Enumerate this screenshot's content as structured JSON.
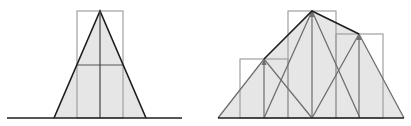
{
  "colors": {
    "fill": "#e6e6e6",
    "rect_stroke": "#a0a0a0",
    "triangle_stroke": "#6e6e6e",
    "hull_stroke": "#1e1e1e",
    "baseline": "#1e1e1e",
    "background": "#ffffff"
  },
  "panels": [
    {
      "name": "single-kernel",
      "baseline": {
        "x1": 7,
        "x2": 182,
        "y": 118
      },
      "rects": [
        {
          "x": 77,
          "y": 11,
          "w": 46,
          "h": 107
        }
      ],
      "midline_y": 65,
      "triangles": [
        {
          "apex": [
            100,
            11
          ],
          "left": [
            54,
            118
          ],
          "right": [
            146,
            118
          ]
        }
      ],
      "hull": [
        [
          54,
          118
        ],
        [
          100,
          11
        ],
        [
          146,
          118
        ]
      ]
    },
    {
      "name": "sum-of-kernels",
      "baseline": {
        "x1": 218,
        "x2": 404,
        "y": 118
      },
      "rects": [
        {
          "x": 240,
          "y": 59,
          "w": 48,
          "h": 59
        },
        {
          "x": 288,
          "y": 11,
          "w": 48,
          "h": 107
        },
        {
          "x": 336,
          "y": 34,
          "w": 47,
          "h": 84
        }
      ],
      "triangles": [
        {
          "apex": [
            264,
            59
          ],
          "left": [
            218,
            118
          ],
          "right": [
            312,
            118
          ]
        },
        {
          "apex": [
            312,
            11
          ],
          "left": [
            264,
            118
          ],
          "right": [
            360,
            118
          ]
        },
        {
          "apex": [
            359,
            34
          ],
          "left": [
            312,
            118
          ],
          "right": [
            404,
            118
          ]
        }
      ],
      "hull": [
        [
          218,
          118
        ],
        [
          264,
          59
        ],
        [
          312,
          11
        ],
        [
          359,
          34
        ],
        [
          404,
          118
        ]
      ]
    }
  ]
}
